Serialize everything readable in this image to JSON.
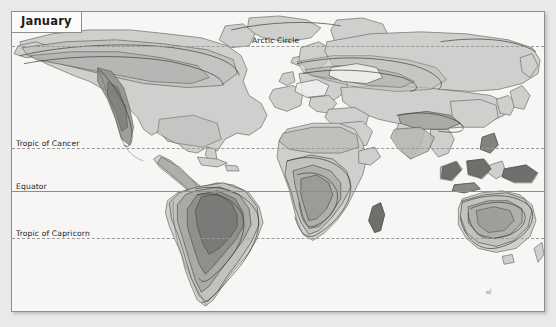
{
  "figure": {
    "type": "thematic-world-map",
    "title": "January",
    "projection_hint": "cylindrical world map",
    "background_color": "#e9e9e7",
    "ocean_color": "#f6f6f4",
    "frame_border_color": "#8e8e8c"
  },
  "legend_colors": {
    "ocean": "#f6f6f4",
    "land_base": "#cfcfcd",
    "band_1": "#c2c2bf",
    "band_2": "#a9a9a6",
    "band_3": "#8f8f8c",
    "band_4": "#7a7a78",
    "contour_line": "#4a4a48",
    "coastline": "#55555300"
  },
  "reference_lines": [
    {
      "name": "arctic-circle",
      "label": "Arctic Circle",
      "style": "dashed",
      "y": 45,
      "label_x": 251,
      "label_y": 37
    },
    {
      "name": "tropic-of-cancer",
      "label": "Tropic of Cancer",
      "style": "dashed",
      "y": 147,
      "label_x": 6,
      "label_y": 139
    },
    {
      "name": "equator",
      "label": "Equator",
      "style": "solid",
      "y": 190,
      "label_x": 6,
      "label_y": 182
    },
    {
      "name": "tropic-of-capricorn",
      "label": "Tropic of Capricorn",
      "style": "dashed",
      "y": 237,
      "label_x": 6,
      "label_y": 229
    }
  ],
  "signature": {
    "text": "sf",
    "x": 485,
    "y": 289
  },
  "regions": [
    {
      "name": "north-america",
      "shading": "banded",
      "max_band": 3
    },
    {
      "name": "south-america",
      "shading": "banded",
      "max_band": 4,
      "core": "amazon-basin"
    },
    {
      "name": "africa",
      "shading": "banded",
      "max_band": 3,
      "core": "southern-africa"
    },
    {
      "name": "eurasia",
      "shading": "banded",
      "max_band": 2
    },
    {
      "name": "southeast-asia",
      "shading": "banded",
      "max_band": 4
    },
    {
      "name": "australia",
      "shading": "banded",
      "max_band": 3
    },
    {
      "name": "new-guinea",
      "shading": "banded",
      "max_band": 4
    },
    {
      "name": "madagascar",
      "shading": "banded",
      "max_band": 4
    }
  ]
}
